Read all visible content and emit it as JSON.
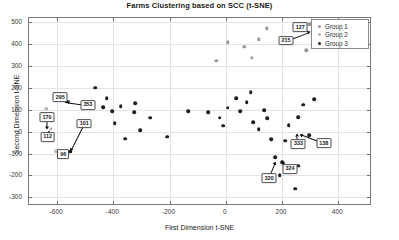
{
  "chart_data": {
    "type": "scatter",
    "title": "Farms Clustering based on SCC (t-SNE)",
    "xlabel": "First Dimension t-SNE",
    "ylabel": "Second Dimension t-SNE",
    "xlim": [
      -700,
      520
    ],
    "ylim": [
      -340,
      520
    ],
    "xticks": [
      -600,
      -400,
      -200,
      0,
      200,
      400
    ],
    "yticks": [
      500,
      400,
      300,
      200,
      100,
      0,
      -100,
      -200,
      -300
    ],
    "grid": true,
    "legend_position": "top-right",
    "legend": [
      {
        "name": "Group 1",
        "color": "#9a9a9a"
      },
      {
        "name": "Group 2",
        "color": "#b4b4b4"
      },
      {
        "name": "Group 3",
        "color": "#1f1f1f"
      }
    ],
    "series": [
      {
        "name": "Group 1",
        "color": "#9a9a9a",
        "points": [
          [
            -30,
            320
          ],
          [
            10,
            405
          ],
          [
            70,
            383
          ],
          [
            95,
            333
          ],
          [
            120,
            418
          ],
          [
            150,
            468
          ],
          [
            245,
            480
          ],
          [
            300,
            487
          ],
          [
            290,
            368
          ]
        ]
      },
      {
        "name": "Group 2",
        "color": "#b4b4b4",
        "points": [
          [
            -635,
            100
          ],
          [
            -618,
            8
          ],
          [
            -600,
            -95
          ]
        ]
      },
      {
        "name": "Group 3",
        "color": "#1f1f1f",
        "points": [
          [
            -560,
            133
          ],
          [
            -548,
            -96
          ],
          [
            -460,
            196
          ],
          [
            -420,
            148
          ],
          [
            -432,
            108
          ],
          [
            -400,
            88
          ],
          [
            -392,
            35
          ],
          [
            -370,
            112
          ],
          [
            -355,
            -37
          ],
          [
            -318,
            127
          ],
          [
            -322,
            85
          ],
          [
            -300,
            1
          ],
          [
            -265,
            60
          ],
          [
            -205,
            -28
          ],
          [
            -130,
            90
          ],
          [
            -60,
            85
          ],
          [
            -18,
            60
          ],
          [
            -5,
            22
          ],
          [
            10,
            105
          ],
          [
            40,
            148
          ],
          [
            55,
            88
          ],
          [
            78,
            130
          ],
          [
            92,
            175
          ],
          [
            100,
            40
          ],
          [
            120,
            8
          ],
          [
            140,
            95
          ],
          [
            150,
            58
          ],
          [
            165,
            -38
          ],
          [
            180,
            -120
          ],
          [
            195,
            -205
          ],
          [
            205,
            -145
          ],
          [
            215,
            -45
          ],
          [
            228,
            25
          ],
          [
            240,
            -165
          ],
          [
            250,
            -265
          ],
          [
            262,
            62
          ],
          [
            278,
            118
          ],
          [
            300,
            -22
          ],
          [
            318,
            145
          ],
          [
            262,
            -160
          ]
        ]
      }
    ],
    "annotations": [
      {
        "label": "295",
        "box_x": -585,
        "box_y": 152,
        "tip_x": -560,
        "tip_y": 133
      },
      {
        "label": "353",
        "box_x": -487,
        "box_y": 118,
        "tip_x": -556,
        "tip_y": 131
      },
      {
        "label": "170",
        "box_x": -632,
        "box_y": 62,
        "tip_x": -633,
        "tip_y": 12
      },
      {
        "label": "101",
        "box_x": -500,
        "box_y": 32,
        "tip_x": -548,
        "tip_y": -90
      },
      {
        "label": "112",
        "box_x": -630,
        "box_y": -28,
        "tip_x": -627,
        "tip_y": -8
      },
      {
        "label": "96",
        "box_x": -575,
        "box_y": -108,
        "tip_x": -549,
        "tip_y": -95
      },
      {
        "label": "127",
        "box_x": 268,
        "box_y": 472,
        "tip_x": 246,
        "tip_y": 480
      },
      {
        "label": "215",
        "box_x": 218,
        "box_y": 412,
        "tip_x": 300,
        "tip_y": 452
      },
      {
        "label": "333",
        "box_x": 262,
        "box_y": -60,
        "tip_x": 258,
        "tip_y": -22
      },
      {
        "label": "138",
        "box_x": 352,
        "box_y": -58,
        "tip_x": 272,
        "tip_y": -18
      },
      {
        "label": "324",
        "box_x": 232,
        "box_y": -175,
        "tip_x": 206,
        "tip_y": -148
      },
      {
        "label": "320",
        "box_x": 158,
        "box_y": -218,
        "tip_x": 180,
        "tip_y": -148
      }
    ]
  }
}
